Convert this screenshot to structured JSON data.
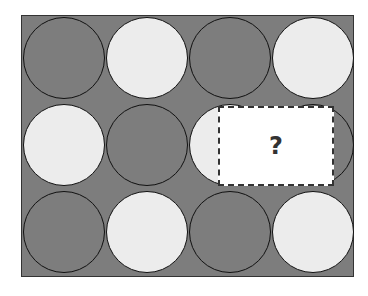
{
  "puzzle": {
    "rows": [
      [
        "dark",
        "light",
        "dark",
        "light"
      ],
      [
        "light",
        "dark",
        "light",
        "dark"
      ],
      [
        "dark",
        "light",
        "dark",
        "light"
      ]
    ],
    "missing_label": "?",
    "colors": {
      "dark": "#7d7d7d",
      "light": "#ececec",
      "background": "#7d7d7d"
    }
  }
}
